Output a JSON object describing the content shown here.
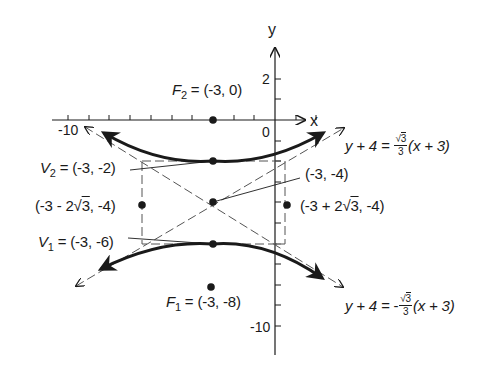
{
  "figure": {
    "axes": {
      "x_label": "x",
      "y_label": "y",
      "origin_label": "0",
      "x_tick_labels": [
        {
          "value": -10,
          "text": "-10"
        }
      ],
      "y_tick_labels": [
        {
          "value": 2,
          "text": "2"
        },
        {
          "value": -10,
          "text": "-10"
        }
      ],
      "x_range": [
        -10.5,
        1.5
      ],
      "y_range": [
        -11.5,
        3.5
      ],
      "tick_step": 1
    },
    "points": {
      "F2": {
        "name": "F",
        "sub": "2",
        "coords": "(-3, 0)",
        "x": -3,
        "y": 0
      },
      "V2": {
        "name": "V",
        "sub": "2",
        "coords": "(-3, -2)",
        "x": -3,
        "y": -2
      },
      "center": {
        "coords": "(-3, -4)",
        "x": -3,
        "y": -4
      },
      "co_vertex_left": {
        "prefix": "(-3 - 2",
        "root": "3",
        "suffix": ", -4)",
        "x": -6.464,
        "y": -4
      },
      "co_vertex_right": {
        "prefix": "(-3 + 2",
        "root": "3",
        "suffix": ", -4)",
        "x": 0.464,
        "y": -4
      },
      "V1": {
        "name": "V",
        "sub": "1",
        "coords": "(-3, -6)",
        "x": -3,
        "y": -6
      },
      "F1": {
        "name": "F",
        "sub": "1",
        "coords": "(-3, -8)",
        "x": -3,
        "y": -8
      }
    },
    "asymptotes": {
      "upper": {
        "lhs": "y + 4 = ",
        "sign": "",
        "num": "3",
        "den": "3",
        "rhs": "(x + 3)"
      },
      "lower": {
        "lhs": "y + 4 = ",
        "sign": "-",
        "num": "3",
        "den": "3",
        "rhs": "(x + 3)"
      }
    },
    "equals_sign": "=",
    "sqrt_symbol": "√",
    "colors": {
      "ink": "#1a1a1a",
      "dashed": "#555555",
      "background": "#ffffff"
    }
  }
}
